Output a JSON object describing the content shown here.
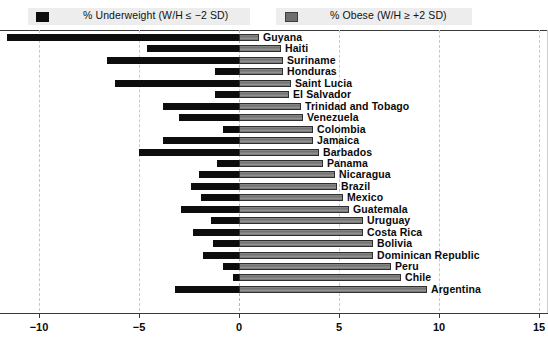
{
  "legend": {
    "items": [
      {
        "label": "% Underweight (W/H ≤ −2 SD)",
        "color": "#0d0d0d",
        "icon": "filled-square-black"
      },
      {
        "label": "% Obese (W/H ≥ +2 SD)",
        "color": "#6e6e6e",
        "icon": "filled-square-gray"
      }
    ]
  },
  "axis": {
    "ticks": [
      "−10",
      "−5",
      "0",
      "5",
      "10",
      "15"
    ]
  },
  "chart_data": {
    "type": "bar",
    "orientation": "horizontal",
    "title": "",
    "subtitle": "",
    "xlabel": "",
    "ylabel": "",
    "xlim": [
      -12.5,
      15.4
    ],
    "xticks": [
      -10,
      -5,
      0,
      5,
      10,
      15
    ],
    "grid": true,
    "grid_style": "dashed vertical gridlines at x ticks",
    "legend_position": "top",
    "categories": [
      "Guyana",
      "Haiti",
      "Suriname",
      "Honduras",
      "Saint Lucia",
      "El Salvador",
      "Trinidad and Tobago",
      "Venezuela",
      "Colombia",
      "Jamaica",
      "Barbados",
      "Panama",
      "Nicaragua",
      "Brazil",
      "Mexico",
      "Guatemala",
      "Uruguay",
      "Costa Rica",
      "Bolivia",
      "Dominican Republic",
      "Peru",
      "Chile",
      "Argentina"
    ],
    "series": [
      {
        "name": "% Underweight (W/H ≤ −2 SD)",
        "color": "#0d0d0d",
        "values": [
          -11.6,
          -4.6,
          -6.6,
          -1.2,
          -6.2,
          -1.2,
          -3.8,
          -3.0,
          -0.8,
          -3.8,
          -5.0,
          -1.1,
          -2.0,
          -2.4,
          -1.9,
          -2.9,
          -1.4,
          -2.3,
          -1.3,
          -1.8,
          -0.8,
          -0.3,
          -3.2
        ]
      },
      {
        "name": "% Obese (W/H ≥ +2 SD)",
        "color": "#6e6e6e",
        "values": [
          1.0,
          2.1,
          2.2,
          2.2,
          2.6,
          2.5,
          3.1,
          3.2,
          3.7,
          3.7,
          4.0,
          4.2,
          4.8,
          4.9,
          5.2,
          5.5,
          6.2,
          6.2,
          6.7,
          6.7,
          7.6,
          8.1,
          9.4
        ]
      }
    ]
  }
}
